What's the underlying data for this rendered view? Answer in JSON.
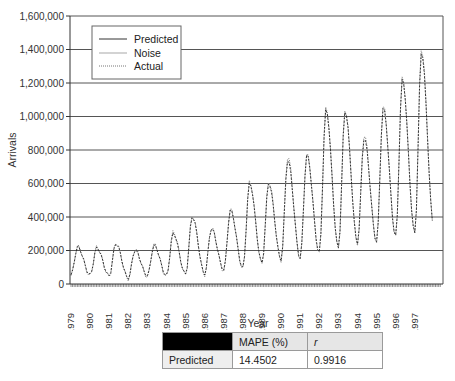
{
  "chart_data": {
    "type": "line",
    "title": "",
    "xlabel": "Year",
    "ylabel": "Arrivals",
    "ylim": [
      0,
      1600000
    ],
    "yticks": [
      "0",
      "200,000",
      "400,000",
      "600,000",
      "800,000",
      "1,000,000",
      "1,200,000",
      "1,400,000",
      "1,600,000"
    ],
    "ytick_values": [
      0,
      200000,
      400000,
      600000,
      800000,
      1000000,
      1200000,
      1400000,
      1600000
    ],
    "categories": [
      "1979",
      "1980",
      "1981",
      "1982",
      "1983",
      "1984",
      "1985",
      "1986",
      "1987",
      "1988",
      "1989",
      "1990",
      "1991",
      "1992",
      "1993",
      "1994",
      "1995",
      "1996",
      "1997"
    ],
    "grid": true,
    "legend_position": "upper-left",
    "legend": [
      "Predicted",
      "Noise",
      "Actual"
    ],
    "series": [
      {
        "name": "Actual",
        "style": "dotted",
        "peaks": [
          225000,
          220000,
          245000,
          205000,
          235000,
          310000,
          405000,
          335000,
          445000,
          610000,
          610000,
          760000,
          775000,
          1050000,
          1040000,
          890000,
          1060000,
          1230000,
          1400000
        ],
        "troughs": [
          50000,
          45000,
          30000,
          45000,
          45000,
          55000,
          55000,
          80000,
          90000,
          120000,
          140000,
          150000,
          180000,
          210000,
          240000,
          250000,
          280000,
          300000,
          330000
        ]
      },
      {
        "name": "Predicted",
        "style": "solid",
        "peaks": [
          220000,
          215000,
          240000,
          200000,
          230000,
          300000,
          400000,
          330000,
          440000,
          600000,
          600000,
          740000,
          770000,
          1040000,
          1030000,
          870000,
          1050000,
          1220000,
          1380000
        ],
        "troughs": [
          55000,
          50000,
          35000,
          50000,
          50000,
          60000,
          60000,
          85000,
          95000,
          125000,
          145000,
          155000,
          185000,
          215000,
          245000,
          255000,
          285000,
          305000,
          335000
        ]
      },
      {
        "name": "Noise",
        "style": "solid-light",
        "peaks": [],
        "troughs": []
      }
    ]
  },
  "legend": {
    "items": [
      {
        "label": "Predicted",
        "style": "solid"
      },
      {
        "label": "Noise",
        "style": "light"
      },
      {
        "label": "Actual",
        "style": "dotted"
      }
    ]
  },
  "axes": {
    "xlabel": "Year",
    "ylabel": "Arrivals"
  },
  "metrics_table": {
    "headers": [
      "",
      "MAPE (%)",
      "r"
    ],
    "rows": [
      {
        "label": "Predicted",
        "mape": "14.4502",
        "r": "0.9916"
      }
    ]
  }
}
